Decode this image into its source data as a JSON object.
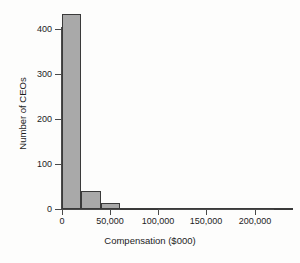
{
  "chart_data": {
    "type": "bar",
    "title": "",
    "subtitle": "",
    "xlabel": "Compensation ($000)",
    "ylabel": "Number of CEOs",
    "xlim": [
      0,
      240000
    ],
    "ylim": [
      0,
      440
    ],
    "grid": false,
    "legend": null,
    "bin_width": 20000,
    "x_tick_labels": [
      "0",
      "50,000",
      "100,000",
      "150,000",
      "200,000"
    ],
    "x_tick_values": [
      0,
      50000,
      100000,
      150000,
      200000
    ],
    "y_tick_labels": [
      "0",
      "100",
      "200",
      "300",
      "400"
    ],
    "y_tick_values": [
      0,
      100,
      200,
      300,
      400
    ],
    "categories": [
      "0-20,000",
      "20,000-40,000",
      "40,000-60,000",
      "60,000-80,000",
      "80,000-100,000",
      "100,000-120,000",
      "120,000-140,000",
      "140,000-160,000",
      "160,000-180,000",
      "180,000-200,000",
      "200,000-220,000",
      "220,000-240,000"
    ],
    "bin_starts": [
      0,
      20000,
      40000,
      60000,
      80000,
      100000,
      120000,
      140000,
      160000,
      180000,
      200000,
      220000
    ],
    "bin_ends": [
      20000,
      40000,
      60000,
      80000,
      100000,
      120000,
      140000,
      160000,
      180000,
      200000,
      220000,
      240000
    ],
    "values": [
      434,
      40,
      13,
      3,
      3,
      0,
      1,
      1,
      0,
      0,
      0,
      2
    ],
    "bar_fill_color": "#a9a9a9",
    "bar_edge_color": "#3a3a3a",
    "axis_color": "#4a4a4a",
    "background_color": "#fdfdfc"
  }
}
